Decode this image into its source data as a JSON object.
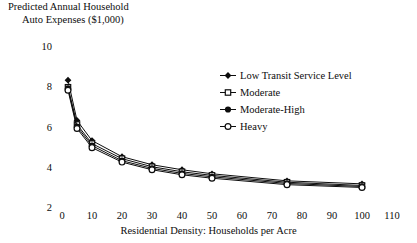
{
  "title": {
    "line1": "Predicted Annual Household",
    "line2": "Auto Expenses ($1,000)"
  },
  "axes": {
    "xlabel": "Residential Density: Households per Acre",
    "ylabel": "Predicted Annual Household Auto Expenses ($1,000)",
    "xticks": [
      "0",
      "10",
      "20",
      "30",
      "40",
      "50",
      "60",
      "70",
      "80",
      "90",
      "100",
      "110"
    ],
    "yticks": [
      "10",
      "8",
      "6",
      "4",
      "2"
    ]
  },
  "legend": {
    "items": [
      {
        "label": "Low Transit Service Level",
        "marker": "filled-diamond-icon"
      },
      {
        "label": "Moderate",
        "marker": "open-square-icon"
      },
      {
        "label": "Moderate-High",
        "marker": "filled-circle-icon"
      },
      {
        "label": "Heavy",
        "marker": "open-circle-icon"
      }
    ]
  },
  "chart_data": {
    "type": "line",
    "title": "Predicted Annual Household Auto Expenses ($1,000)",
    "xlabel": "Residential Density: Households per Acre",
    "ylabel": "Predicted Annual Household Auto Expenses ($1,000)",
    "xlim": [
      0,
      110
    ],
    "ylim": [
      2,
      10
    ],
    "xticks": [
      0,
      10,
      20,
      30,
      40,
      50,
      60,
      70,
      80,
      90,
      100,
      110
    ],
    "yticks": [
      2,
      4,
      6,
      8,
      10
    ],
    "grid": false,
    "legend_position": "upper right",
    "x": [
      2,
      5,
      10,
      20,
      30,
      40,
      50,
      75,
      100
    ],
    "series": [
      {
        "name": "Low Transit Service Level",
        "marker": "filled-diamond-icon",
        "values": [
          8.35,
          6.35,
          5.35,
          4.55,
          4.15,
          3.9,
          3.7,
          3.35,
          3.2
        ]
      },
      {
        "name": "Moderate",
        "marker": "open-square-icon",
        "values": [
          8.0,
          6.15,
          5.2,
          4.45,
          4.05,
          3.8,
          3.62,
          3.28,
          3.12
        ]
      },
      {
        "name": "Moderate-High",
        "marker": "filled-circle-icon",
        "values": [
          7.95,
          6.05,
          5.1,
          4.35,
          3.97,
          3.72,
          3.55,
          3.22,
          3.07
        ]
      },
      {
        "name": "Heavy",
        "marker": "open-circle-icon",
        "values": [
          7.85,
          5.95,
          5.0,
          4.28,
          3.9,
          3.65,
          3.48,
          3.16,
          3.02
        ]
      }
    ]
  },
  "colors": {
    "ink": "#0d0d0d",
    "background": "#ffffff"
  }
}
